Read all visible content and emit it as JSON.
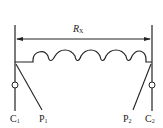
{
  "diagram": {
    "resistor_label": "R",
    "resistor_subscript": "X",
    "terminals": [
      {
        "name": "C",
        "sub": "1"
      },
      {
        "name": "P",
        "sub": "1"
      },
      {
        "name": "P",
        "sub": "2"
      },
      {
        "name": "C",
        "sub": "2"
      }
    ],
    "colors": {
      "stroke": "#222222",
      "background": "#ffffff"
    }
  }
}
